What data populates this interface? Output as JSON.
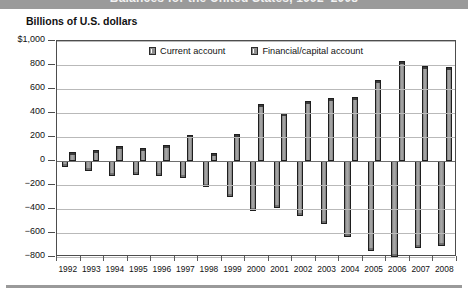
{
  "header": {
    "title_partial": "Balances for the United States, 1992–2008",
    "subtitle": "Billions of U.S. dollars"
  },
  "legend": {
    "position": "top-center",
    "items": [
      {
        "label": "Current account",
        "swatch_color": "#8f8f8f"
      },
      {
        "label": "Financial/capital account",
        "swatch_color": "#8f8f8f"
      }
    ]
  },
  "axes": {
    "y_ticks": [
      "$1,000",
      "800",
      "600",
      "400",
      "200",
      "0",
      "−200",
      "−400",
      "−600",
      "−800"
    ],
    "y_values": [
      1000,
      800,
      600,
      400,
      200,
      0,
      -200,
      -400,
      -600,
      -800
    ]
  },
  "chart_data": {
    "type": "bar",
    "title": "Balances for the United States, 1992–2008",
    "xlabel": "",
    "ylabel": "Billions of U.S. dollars",
    "ylim": [
      -800,
      1000
    ],
    "ytick_step": 200,
    "grid": true,
    "legend_position": "top-center",
    "categories": [
      "1992",
      "1993",
      "1994",
      "1995",
      "1996",
      "1997",
      "1998",
      "1999",
      "2000",
      "2001",
      "2002",
      "2003",
      "2004",
      "2005",
      "2006",
      "2007",
      "2008"
    ],
    "series": [
      {
        "name": "Current account",
        "values": [
          -50,
          -82,
          -122,
          -114,
          -125,
          -141,
          -215,
          -301,
          -417,
          -395,
          -458,
          -521,
          -631,
          -749,
          -803,
          -727,
          -706
        ]
      },
      {
        "name": "Financial/capital account",
        "values": [
          72,
          88,
          122,
          112,
          133,
          215,
          70,
          223,
          473,
          401,
          503,
          529,
          532,
          671,
          832,
          788,
          784
        ]
      }
    ]
  }
}
